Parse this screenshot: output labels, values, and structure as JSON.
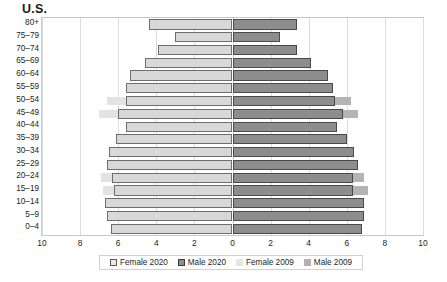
{
  "chart_data": {
    "type": "bar",
    "title": "U.S.",
    "subtitle": "",
    "xlabel": "",
    "ylabel": "",
    "orientation": "horizontal",
    "variant": "population-pyramid",
    "grid": true,
    "legend_position": "bottom",
    "xlim": [
      -10,
      10
    ],
    "xticks": [
      10,
      8,
      6,
      4,
      2,
      0,
      2,
      4,
      6,
      8,
      10
    ],
    "xtick_labels": [
      "10",
      "8",
      "6",
      "4",
      "2",
      "0",
      "2",
      "4",
      "6",
      "8",
      "10"
    ],
    "categories": [
      "80+",
      "75–79",
      "70–74",
      "65–69",
      "60–64",
      "55–59",
      "50–54",
      "45–49",
      "40–44",
      "35–39",
      "30–34",
      "25–29",
      "20–24",
      "15–19",
      "10–14",
      "5–9",
      "0–4"
    ],
    "series": [
      {
        "name": "Female 2020",
        "side": "left",
        "color": "#d8d8d8",
        "border": "#6e6e6e",
        "values": [
          4.4,
          3.0,
          3.9,
          4.6,
          5.4,
          5.6,
          5.6,
          6.0,
          5.6,
          6.1,
          6.5,
          6.6,
          6.3,
          6.2,
          6.7,
          6.6,
          6.4
        ]
      },
      {
        "name": "Male 2020",
        "side": "right",
        "color": "#8d8d8d",
        "border": "#4a4a4a",
        "values": [
          3.4,
          2.5,
          3.4,
          4.1,
          5.0,
          5.3,
          5.4,
          5.8,
          5.5,
          6.0,
          6.4,
          6.6,
          6.3,
          6.3,
          6.9,
          6.9,
          6.8
        ]
      },
      {
        "name": "Female 2009",
        "side": "left",
        "color": "#e3e3e3",
        "border": "#e3e3e3",
        "values": [
          4.4,
          3.0,
          3.9,
          4.6,
          5.4,
          5.6,
          6.6,
          7.0,
          5.6,
          6.1,
          6.5,
          6.6,
          6.9,
          6.8,
          6.7,
          6.6,
          6.4
        ]
      },
      {
        "name": "Male 2009",
        "side": "right",
        "color": "#b4b4b4",
        "border": "#b4b4b4",
        "values": [
          3.4,
          2.5,
          3.4,
          4.1,
          5.0,
          5.3,
          6.2,
          6.6,
          5.5,
          6.0,
          6.4,
          6.6,
          6.9,
          7.1,
          6.9,
          6.9,
          6.8
        ]
      }
    ]
  },
  "legend": {
    "items": [
      {
        "label": "Female 2020",
        "swatch": "sw-f2020"
      },
      {
        "label": "Male 2020",
        "swatch": "sw-m2020"
      },
      {
        "label": "Female 2009",
        "swatch": "sw-f2009"
      },
      {
        "label": "Male 2009",
        "swatch": "sw-m2009"
      }
    ]
  }
}
